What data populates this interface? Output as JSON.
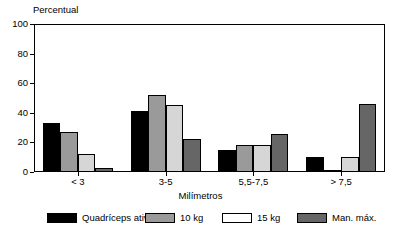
{
  "chart_data": {
    "type": "bar",
    "title": "",
    "ylabel": "Percentual",
    "xlabel": "Milímetros",
    "categories": [
      "< 3",
      "3-5",
      "5,5-7,5",
      "> 7,5"
    ],
    "ylim": [
      0,
      100
    ],
    "yticks": [
      0,
      20,
      40,
      60,
      80,
      100
    ],
    "grid": false,
    "legend_position": "bottom",
    "series": [
      {
        "name": "Quadríceps ativo",
        "color": "#000000",
        "values": [
          33,
          41,
          15,
          10
        ]
      },
      {
        "name": "10 kg",
        "color": "#9a9a9a",
        "values": [
          27,
          52,
          18,
          1
        ]
      },
      {
        "name": "15 kg",
        "color": "#d6d6d6",
        "values": [
          12,
          45,
          18,
          10
        ]
      },
      {
        "name": "Man. máx.",
        "color": "#666666",
        "values": [
          3,
          22,
          26,
          46
        ]
      }
    ]
  }
}
